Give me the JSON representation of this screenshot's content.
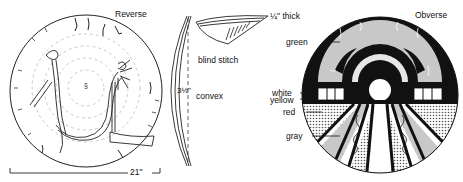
{
  "reverse": {
    "label": "Reverse",
    "dimension": "21\""
  },
  "profile": {
    "height_label": "3½\"",
    "shape_label": "convex",
    "stitch_label": "blind stitch",
    "thickness_label": "¼\" thick"
  },
  "obverse": {
    "label": "Obverse",
    "color_labels": [
      "green",
      "white",
      "yellow",
      "red",
      "gray"
    ]
  },
  "colors": {
    "ink": "#111111",
    "gray_fill": "#c8c8c8",
    "light_fill": "#e6e6e6",
    "paper": "#ffffff"
  }
}
